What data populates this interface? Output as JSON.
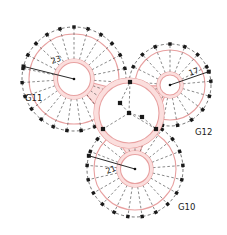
{
  "diagram": {
    "background_color": "#ffffff",
    "gear_stroke_color": "#e8a0a0",
    "gear_fill_color": "#fbdedd",
    "dash_color": "#3a3a3a",
    "marker_color": "#1a1a1a",
    "text_color": "#1a1a1a"
  },
  "gears": [
    {
      "id": "G11",
      "label": "G11",
      "teeth_label": "23",
      "label_x": 25,
      "label_y": 101,
      "cx": 74,
      "cy": 79,
      "outer_r": 52,
      "pitch_r": 45,
      "hub_outer_r": 20,
      "hub_inner_r": 16.5,
      "teeth": 23,
      "radius_angle_deg": 194,
      "tick_label_x": 52,
      "tick_label_y": 64,
      "tick_label_rot": -19
    },
    {
      "id": "G12",
      "label": "G12",
      "teeth_label": "17",
      "label_x": 195,
      "label_y": 135,
      "cx": 170,
      "cy": 85,
      "outer_r": 41,
      "pitch_r": 35,
      "hub_outer_r": 13,
      "hub_inner_r": 10,
      "teeth": 17,
      "radius_angle_deg": 341,
      "tick_label_x": 190,
      "tick_label_y": 76,
      "tick_label_rot": -21
    },
    {
      "id": "G10",
      "label": "G10",
      "teeth_label": "21",
      "label_x": 178,
      "label_y": 210,
      "cx": 135,
      "cy": 169,
      "outer_r": 48,
      "pitch_r": 41,
      "hub_outer_r": 18,
      "hub_inner_r": 14.5,
      "teeth": 21,
      "radius_angle_deg": 196,
      "tick_label_x": 107,
      "tick_label_y": 174,
      "tick_label_rot": -21
    }
  ],
  "carrier": {
    "id": "carrier",
    "cx": 129,
    "cy": 113,
    "outer_r": 35,
    "inner_r": 30,
    "pin_markers": [
      {
        "x": 129,
        "y": 113
      },
      {
        "x": 130,
        "y": 82
      },
      {
        "x": 103,
        "y": 129
      },
      {
        "x": 156,
        "y": 129
      },
      {
        "x": 120,
        "y": 103
      },
      {
        "x": 142,
        "y": 117
      }
    ]
  },
  "links": [
    {
      "from": "carrier",
      "to": "G11"
    },
    {
      "from": "carrier",
      "to": "G12"
    },
    {
      "from": "carrier",
      "to": "G10"
    }
  ]
}
